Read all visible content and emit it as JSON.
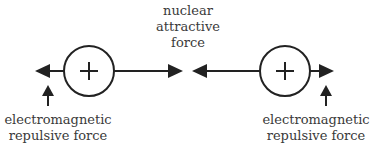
{
  "diagram": {
    "type": "nuclear-forces-between-two-protons",
    "colors": {
      "stroke": "#222222",
      "text": "#3a3a3a",
      "background": "#ffffff"
    },
    "particles": [
      {
        "id": "left-proton",
        "symbol": "+",
        "charge": "positive"
      },
      {
        "id": "right-proton",
        "symbol": "+",
        "charge": "positive"
      }
    ],
    "labels": {
      "nuclear": {
        "lines": [
          "nuclear",
          "attractive",
          "force"
        ]
      },
      "em_left": {
        "lines": [
          "electromagnetic",
          "repulsive force"
        ]
      },
      "em_right": {
        "lines": [
          "electromagnetic",
          "repulsive force"
        ]
      }
    },
    "arrows": [
      {
        "name": "left-em-repulsion-arrow",
        "direction": "left",
        "meaning": "electromagnetic repulsive force"
      },
      {
        "name": "left-nuclear-attraction-arrow",
        "direction": "right",
        "meaning": "nuclear attractive force"
      },
      {
        "name": "right-nuclear-attraction-arrow",
        "direction": "left",
        "meaning": "nuclear attractive force"
      },
      {
        "name": "right-em-repulsion-arrow",
        "direction": "right",
        "meaning": "electromagnetic repulsive force"
      },
      {
        "name": "left-pointer-arrow",
        "direction": "up",
        "meaning": "points to left electromagnetic arrow"
      },
      {
        "name": "right-pointer-arrow",
        "direction": "up",
        "meaning": "points to right electromagnetic arrow"
      }
    ]
  }
}
